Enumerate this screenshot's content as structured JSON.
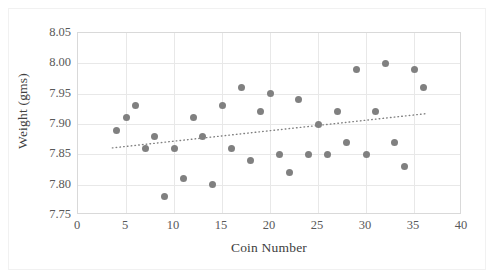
{
  "chart_data": {
    "type": "scatter",
    "title": "",
    "xlabel": "Coin Number",
    "ylabel": "Weight (gms)",
    "xlim": [
      0,
      40
    ],
    "ylim": [
      7.75,
      8.05
    ],
    "xticks": [
      0,
      5,
      10,
      15,
      20,
      25,
      30,
      35,
      40
    ],
    "xtick_labels": [
      "0",
      "5",
      "10",
      "15",
      "20",
      "25",
      "30",
      "35",
      "40"
    ],
    "yticks": [
      7.75,
      7.8,
      7.85,
      7.9,
      7.95,
      8.0,
      8.05
    ],
    "ytick_labels": [
      "7.75",
      "7.80",
      "7.85",
      "7.90",
      "7.95",
      "8.00",
      "8.05"
    ],
    "grid": true,
    "grid_axis": "both",
    "legend": false,
    "legend_position": "none",
    "marker": "circle",
    "marker_color": "#808080",
    "marker_size": 7,
    "x": [
      4,
      5,
      6,
      7,
      8,
      9,
      10,
      11,
      12,
      13,
      14,
      15,
      16,
      17,
      18,
      19,
      20,
      21,
      22,
      23,
      24,
      25,
      26,
      27,
      28,
      29,
      30,
      31,
      32,
      33,
      34,
      35,
      36
    ],
    "y": [
      7.89,
      7.91,
      7.93,
      7.86,
      7.88,
      7.78,
      7.86,
      7.81,
      7.91,
      7.88,
      7.8,
      7.93,
      7.86,
      7.96,
      7.84,
      7.92,
      7.95,
      7.85,
      7.82,
      7.94,
      7.85,
      7.9,
      7.85,
      7.92,
      7.87,
      7.99,
      7.85,
      7.92,
      8.0,
      7.87,
      7.83,
      7.99,
      7.96
    ],
    "points": [
      {
        "coin_number": 4,
        "weight": 7.89
      },
      {
        "coin_number": 5,
        "weight": 7.91
      },
      {
        "coin_number": 6,
        "weight": 7.93
      },
      {
        "coin_number": 7,
        "weight": 7.86
      },
      {
        "coin_number": 8,
        "weight": 7.88
      },
      {
        "coin_number": 9,
        "weight": 7.78
      },
      {
        "coin_number": 10,
        "weight": 7.86
      },
      {
        "coin_number": 11,
        "weight": 7.81
      },
      {
        "coin_number": 12,
        "weight": 7.91
      },
      {
        "coin_number": 13,
        "weight": 7.88
      },
      {
        "coin_number": 14,
        "weight": 7.8
      },
      {
        "coin_number": 15,
        "weight": 7.93
      },
      {
        "coin_number": 16,
        "weight": 7.86
      },
      {
        "coin_number": 17,
        "weight": 7.96
      },
      {
        "coin_number": 18,
        "weight": 7.84
      },
      {
        "coin_number": 19,
        "weight": 7.92
      },
      {
        "coin_number": 20,
        "weight": 7.95
      },
      {
        "coin_number": 21,
        "weight": 7.85
      },
      {
        "coin_number": 22,
        "weight": 7.82
      },
      {
        "coin_number": 23,
        "weight": 7.94
      },
      {
        "coin_number": 24,
        "weight": 7.85
      },
      {
        "coin_number": 25,
        "weight": 7.9
      },
      {
        "coin_number": 26,
        "weight": 7.85
      },
      {
        "coin_number": 27,
        "weight": 7.92
      },
      {
        "coin_number": 28,
        "weight": 7.87
      },
      {
        "coin_number": 29,
        "weight": 7.99
      },
      {
        "coin_number": 30,
        "weight": 7.85
      },
      {
        "coin_number": 31,
        "weight": 7.92
      },
      {
        "coin_number": 32,
        "weight": 8.0
      },
      {
        "coin_number": 33,
        "weight": 7.87
      },
      {
        "coin_number": 34,
        "weight": 7.83
      },
      {
        "coin_number": 35,
        "weight": 7.99
      },
      {
        "coin_number": 36,
        "weight": 7.96
      }
    ],
    "trendline": {
      "type": "linear",
      "style": "dotted",
      "color": "#808080",
      "x_start": 3.6,
      "y_start": 7.8585,
      "x_end": 36.4,
      "y_end": 7.9155
    }
  },
  "colors": {
    "marker": "#808080",
    "gridline": "#e8e8e8",
    "axis_border": "#d9d9d9",
    "tick_label": "#595959",
    "axis_title": "#404040",
    "background": "#ffffff"
  }
}
